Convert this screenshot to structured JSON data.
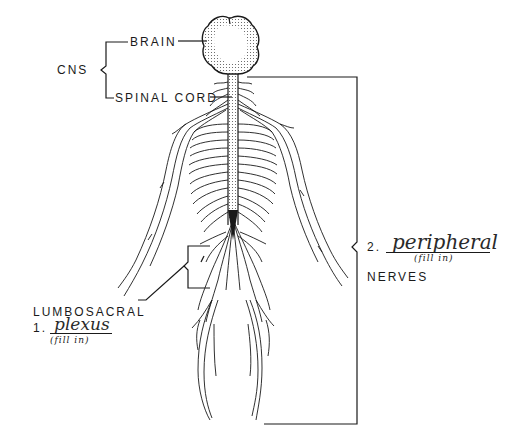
{
  "diagram": {
    "type": "nervous-system-worksheet",
    "colors": {
      "ink": "#1a1a1a",
      "background": "#ffffff",
      "stipple": "#555555"
    }
  },
  "labels": {
    "cns": "CNS",
    "brain": "BRAIN",
    "spinal_cord": "SPINAL CORD",
    "lumbosacral": "LUMBOSACRAL",
    "nerves": "NERVES"
  },
  "blanks": [
    {
      "number": "1.",
      "answer": "plexus",
      "hint": "(fill in)"
    },
    {
      "number": "2.",
      "answer": "peripheral",
      "hint": "(fill in)"
    }
  ]
}
